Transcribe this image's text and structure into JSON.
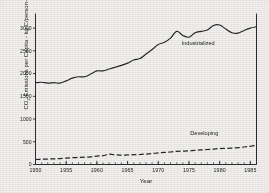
{
  "chart_data": {
    "type": "line",
    "title": "",
    "xlabel": "Year",
    "ylabel": "CO2 Emissions per Capita - kg C/person-year",
    "ylabel_parts": {
      "pre": "CO",
      "sub": "2",
      "post": " Emissions per Capita - kg C/person-year"
    },
    "xlim": [
      1950,
      1986
    ],
    "ylim": [
      0,
      3300
    ],
    "xticks": [
      1950,
      1955,
      1960,
      1965,
      1970,
      1975,
      1980,
      1985
    ],
    "xticklabels": [
      "1950",
      "1955",
      "1960",
      "1965",
      "1970",
      "1975",
      "1980",
      "1985"
    ],
    "xminor_step": 1,
    "yticks": [
      0,
      500,
      1000,
      1500,
      2000,
      2500,
      3000
    ],
    "yticklabels": [
      "0",
      "500",
      "1000",
      "1500",
      "2000",
      "2500",
      "3000"
    ],
    "grid": false,
    "legend_position": "inline-annotations",
    "annotations": [
      {
        "text": "Industrialized",
        "x": 1976.5,
        "y": 2620
      },
      {
        "text": "Developing",
        "x": 1977.5,
        "y": 640
      }
    ],
    "x": [
      1950,
      1951,
      1952,
      1953,
      1954,
      1955,
      1956,
      1957,
      1958,
      1959,
      1960,
      1961,
      1962,
      1963,
      1964,
      1965,
      1966,
      1967,
      1968,
      1969,
      1970,
      1971,
      1972,
      1973,
      1974,
      1975,
      1976,
      1977,
      1978,
      1979,
      1980,
      1981,
      1982,
      1983,
      1984,
      1985,
      1986
    ],
    "series": [
      {
        "name": "Industrialized",
        "style": "solid",
        "color": "#262626",
        "values": [
          1800,
          1810,
          1790,
          1800,
          1790,
          1840,
          1900,
          1930,
          1930,
          1990,
          2060,
          2060,
          2100,
          2140,
          2180,
          2230,
          2300,
          2330,
          2430,
          2530,
          2640,
          2690,
          2780,
          2930,
          2840,
          2800,
          2900,
          2930,
          2960,
          3060,
          3070,
          2980,
          2900,
          2890,
          2950,
          3000,
          3030
        ]
      },
      {
        "name": "Developing",
        "style": "dashed",
        "color": "#262626",
        "values": [
          110,
          115,
          120,
          125,
          130,
          140,
          150,
          155,
          160,
          170,
          185,
          195,
          225,
          215,
          205,
          210,
          215,
          220,
          230,
          240,
          255,
          265,
          275,
          290,
          295,
          300,
          310,
          320,
          330,
          340,
          350,
          355,
          360,
          370,
          385,
          400,
          420
        ]
      }
    ]
  }
}
